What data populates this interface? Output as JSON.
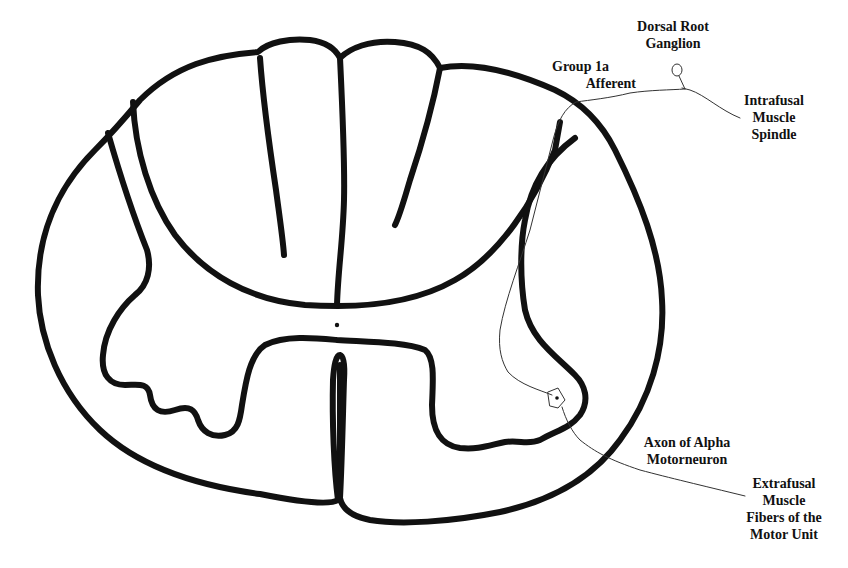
{
  "diagram": {
    "labels": {
      "dorsal_root_ganglion": [
        "Dorsal Root",
        "Ganglion"
      ],
      "group_1a_afferent": [
        "Group 1a",
        "Afferent"
      ],
      "intrafusal_muscle_spindle": [
        "Intrafusal",
        "Muscle",
        "Spindle"
      ],
      "axon_alpha_motorneuron": [
        "Axon of Alpha",
        "Motorneuron"
      ],
      "extrafusal_muscle_fibers": [
        "Extrafusal",
        "Muscle",
        "Fibers of the",
        "Motor Unit"
      ]
    },
    "colors": {
      "outline": "#111111",
      "nerve": "#333333",
      "background": "#ffffff"
    }
  }
}
